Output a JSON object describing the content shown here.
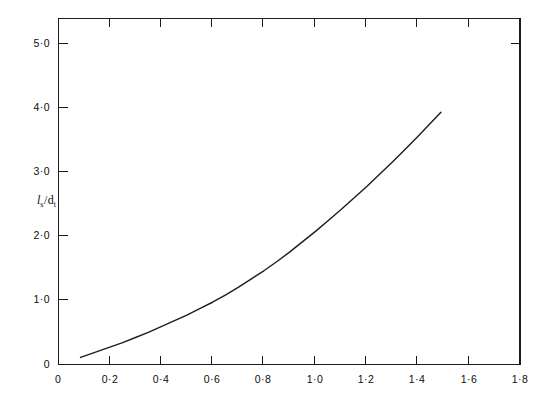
{
  "figure": {
    "background_color": "#ffffff",
    "line_color": "#1f1f1f",
    "axis_color": "#1a1a1a",
    "top_cropped_text": ""
  },
  "chart_data": {
    "type": "line",
    "title": "",
    "subtitle": "",
    "xlabel": "",
    "ylabel": "ls/dt",
    "ylabel_parts": {
      "numerator_symbol": "l",
      "numerator_subscript": "s",
      "separator": "/",
      "denominator_symbol": "d",
      "denominator_subscript": "t"
    },
    "xlim": [
      0,
      1.8
    ],
    "ylim": [
      0,
      5.45
    ],
    "grid": false,
    "legend": "none",
    "xticks": [
      0,
      0.2,
      0.4,
      0.6,
      0.8,
      1.0,
      1.2,
      1.4,
      1.6,
      1.8
    ],
    "xtick_labels": [
      "0",
      "0·2",
      "0·4",
      "0·6",
      "0·8",
      "1·0",
      "1·2",
      "1·4",
      "1·6",
      "1·8"
    ],
    "yticks": [
      0,
      1.0,
      2.0,
      3.0,
      4.0,
      5.0
    ],
    "ytick_labels": [
      "0",
      "1·0",
      "2·0",
      "3·0",
      "4·0",
      "5·0"
    ],
    "right_axis_ticks": [
      5.0
    ],
    "series": [
      {
        "name": "ls/dt curve",
        "x": [
          0.086,
          0.15,
          0.2,
          0.25,
          0.3,
          0.35,
          0.4,
          0.45,
          0.5,
          0.55,
          0.6,
          0.65,
          0.7,
          0.75,
          0.8,
          0.85,
          0.9,
          0.95,
          1.0,
          1.05,
          1.1,
          1.15,
          1.2,
          1.25,
          1.3,
          1.35,
          1.4,
          1.45,
          1.49
        ],
        "y": [
          0.11,
          0.2,
          0.27,
          0.34,
          0.42,
          0.5,
          0.59,
          0.68,
          0.77,
          0.87,
          0.97,
          1.08,
          1.2,
          1.33,
          1.46,
          1.6,
          1.75,
          1.91,
          2.07,
          2.24,
          2.41,
          2.59,
          2.77,
          2.96,
          3.15,
          3.35,
          3.55,
          3.76,
          3.93
        ]
      }
    ],
    "curve_pixel_path": "M80,357 C110,342 140,330 159,326 C190,312 210,285 230,268 C250,250 261,227 280,212 C310,190 330,170 364,145 C390,124 417,95 441,37"
  }
}
